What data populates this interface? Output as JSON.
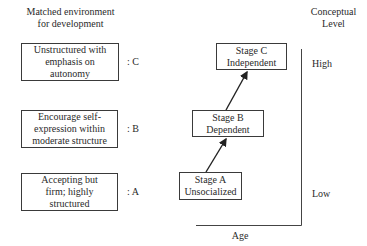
{
  "left_header": [
    "Matched environment",
    "for development"
  ],
  "right_header": [
    "Conceptual",
    "Level"
  ],
  "environments": [
    {
      "lines": [
        "Unstructured with",
        "emphasis on",
        "autonomy"
      ],
      "label": ": C"
    },
    {
      "lines": [
        "Encourage self-",
        "expression within",
        "moderate structure"
      ],
      "label": ": B"
    },
    {
      "lines": [
        "Accepting but",
        "firm; highly",
        "structured"
      ],
      "label": ": A"
    }
  ],
  "stages": [
    {
      "lines": [
        "Stage C",
        "Independent"
      ]
    },
    {
      "lines": [
        "Stage B",
        "Dependent"
      ]
    },
    {
      "lines": [
        "Stage A",
        "Unsocialized"
      ]
    }
  ],
  "axis": {
    "x_label": "Age",
    "y_high": "High",
    "y_low": "Low"
  }
}
